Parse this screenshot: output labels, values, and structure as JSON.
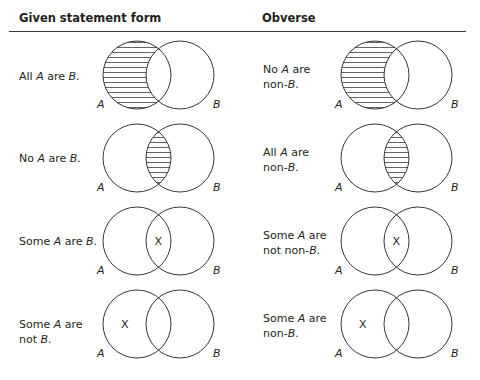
{
  "headers": {
    "given": "Given statement form",
    "obverse": "Obverse"
  },
  "rows": [
    {
      "given": {
        "line1": [
          "All ",
          "A",
          " are ",
          "B",
          "."
        ],
        "line2": null,
        "shade": "A-only",
        "mark": null
      },
      "obverse": {
        "line1": [
          "No ",
          "A",
          " are"
        ],
        "line2": [
          "non-",
          "B",
          "."
        ],
        "shade": "A-only",
        "mark": null
      }
    },
    {
      "given": {
        "line1": [
          "No ",
          "A",
          " are ",
          "B",
          "."
        ],
        "line2": null,
        "shade": "overlap",
        "mark": null
      },
      "obverse": {
        "line1": [
          "All ",
          "A",
          " are"
        ],
        "line2": [
          "non-",
          "B",
          "."
        ],
        "shade": "overlap",
        "mark": null
      }
    },
    {
      "given": {
        "line1": [
          "Some ",
          "A",
          " are ",
          "B",
          "."
        ],
        "line2": null,
        "shade": null,
        "mark": "overlap"
      },
      "obverse": {
        "line1": [
          "Some ",
          "A",
          " are"
        ],
        "line2": [
          "not non-",
          "B",
          "."
        ],
        "shade": null,
        "mark": "overlap"
      }
    },
    {
      "given": {
        "line1": [
          "Some ",
          "A",
          " are"
        ],
        "line2": [
          "not ",
          "B",
          "."
        ],
        "shade": null,
        "mark": "A-only"
      },
      "obverse": {
        "line1": [
          "Some ",
          "A",
          " are"
        ],
        "line2": [
          "non-",
          "B",
          "."
        ],
        "shade": null,
        "mark": "A-only"
      }
    }
  ],
  "labels": {
    "a": "A",
    "b": "B",
    "x": "X"
  },
  "colors": {
    "ink": "#231f20",
    "rule": "#3a3a3a"
  }
}
